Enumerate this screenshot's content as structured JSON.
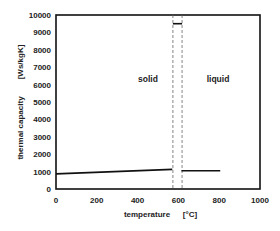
{
  "chart_data": {
    "type": "line",
    "title": "",
    "xlabel": "temperature",
    "xlabel_unit": "[°C]",
    "ylabel": "thermal capacity",
    "ylabel_unit": "[Ws/kgK]",
    "xlim": [
      0,
      1000
    ],
    "ylim": [
      0,
      10000
    ],
    "xticks": [
      0,
      200,
      400,
      600,
      800,
      1000
    ],
    "yticks": [
      0,
      1000,
      2000,
      3000,
      4000,
      5000,
      6000,
      7000,
      8000,
      9000,
      10000
    ],
    "grid": false,
    "legend": null,
    "series": [
      {
        "name": "solid",
        "x": [
          0,
          570
        ],
        "y": [
          870,
          1130
        ]
      },
      {
        "name": "melting",
        "x": [
          573,
          618
        ],
        "y": [
          9500,
          9500
        ]
      },
      {
        "name": "liquid",
        "x": [
          615,
          805
        ],
        "y": [
          1050,
          1050
        ]
      }
    ],
    "reference_lines": [
      {
        "type": "vertical",
        "style": "dashed",
        "x": 573
      },
      {
        "type": "vertical",
        "style": "dashed",
        "x": 618
      }
    ],
    "annotations": [
      {
        "text": "solid",
        "x": 430,
        "y": 6200
      },
      {
        "text": "liquid",
        "x": 770,
        "y": 6200
      }
    ]
  },
  "labels": {
    "xlabel": "temperature",
    "xunit": "[°C]",
    "ylabel": "thermal capacity",
    "yunit": "[Ws/kgK]",
    "solid": "solid",
    "liquid": "liquid"
  }
}
